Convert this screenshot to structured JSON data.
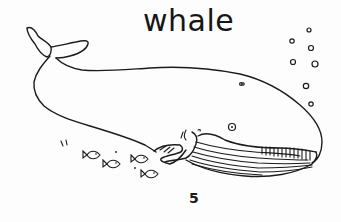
{
  "illustration": {
    "title": "whale",
    "page_number": "5",
    "subject": "whale",
    "elements": [
      "whale",
      "fish-school",
      "bubbles"
    ],
    "fish_count": 4,
    "bubble_count": 8
  }
}
